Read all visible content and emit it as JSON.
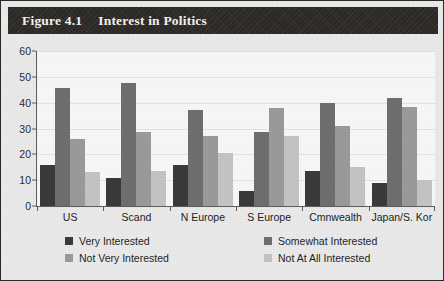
{
  "figure": {
    "number": "Figure 4.1",
    "title": "Interest in Politics"
  },
  "colors": {
    "very": "#3a3a38",
    "somewhat": "#6e6e6e",
    "not_very": "#9a9a9a",
    "not_at_all": "#c3c3c3",
    "header_bg": "#2e2b28",
    "header_text": "#f3f1ee",
    "plot_bg": "#f7f7f7",
    "page_bg": "#e9e9e9",
    "axis": "#5c5c5c",
    "grid": "#e2e2e2"
  },
  "legend": {
    "items": [
      {
        "label": "Very Interested",
        "color": "#3a3a38"
      },
      {
        "label": "Somewhat Interested",
        "color": "#6e6e6e"
      },
      {
        "label": "Not Very Interested",
        "color": "#9a9a9a"
      },
      {
        "label": "Not At All Interested",
        "color": "#c3c3c3"
      }
    ]
  },
  "chart_data": {
    "type": "bar",
    "title": "Interest in Politics",
    "xlabel": "",
    "ylabel": "",
    "ylim": [
      0,
      60
    ],
    "yticks": [
      0,
      10,
      20,
      30,
      40,
      50,
      60
    ],
    "grid": true,
    "legend_position": "bottom",
    "categories": [
      "US",
      "Scand",
      "N Europe",
      "S Europe",
      "Cmnwealth",
      "Japan/S. Kor"
    ],
    "series": [
      {
        "name": "Very Interested",
        "color": "#3a3a38",
        "values": [
          16,
          11,
          16,
          6,
          13.5,
          9
        ]
      },
      {
        "name": "Somewhat Interested",
        "color": "#6e6e6e",
        "values": [
          45.5,
          47.5,
          37,
          28.5,
          40,
          42
        ]
      },
      {
        "name": "Not Very Interested",
        "color": "#9a9a9a",
        "values": [
          26,
          28.5,
          27,
          38,
          31,
          38.5
        ]
      },
      {
        "name": "Not At All Interested",
        "color": "#c3c3c3",
        "values": [
          13,
          13.5,
          20.5,
          27,
          15,
          10
        ]
      }
    ]
  }
}
